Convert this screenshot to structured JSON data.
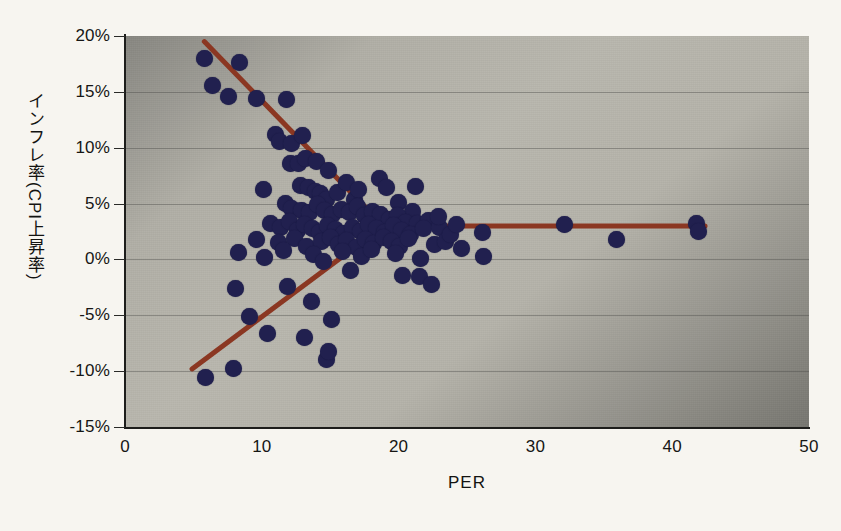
{
  "chart_data": {
    "type": "scatter",
    "title": "",
    "xlabel": "PER",
    "ylabel": "インフレ率(CPI上昇率)",
    "xlim": [
      0,
      50
    ],
    "ylim": [
      -15,
      20
    ],
    "x_ticks": [
      "0",
      "10",
      "20",
      "30",
      "40",
      "50"
    ],
    "x_tick_values": [
      0,
      10,
      20,
      30,
      40,
      50
    ],
    "y_ticks": [
      "20%",
      "15%",
      "10%",
      "5%",
      "0%",
      "-5%",
      "-10%",
      "-15%"
    ],
    "y_tick_values": [
      20,
      15,
      10,
      5,
      0,
      -5,
      -10,
      -15
    ],
    "grid": true,
    "grid_axis": "y",
    "legend": "none",
    "marker_color": "#21204f",
    "trend_color": "#8b3722",
    "plot_bg_color": "#b9b7ae",
    "page_bg_color": "#f7f5f0",
    "axis_color": "#1d1d1b",
    "series": [
      {
        "name": "国・地域",
        "marker": "circle",
        "points": [
          [
            5.8,
            18.0
          ],
          [
            6.4,
            15.6
          ],
          [
            7.6,
            14.6
          ],
          [
            8.4,
            17.6
          ],
          [
            9.6,
            14.4
          ],
          [
            11.8,
            14.3
          ],
          [
            11.0,
            11.2
          ],
          [
            11.3,
            10.6
          ],
          [
            12.2,
            10.4
          ],
          [
            13.0,
            11.1
          ],
          [
            12.1,
            8.6
          ],
          [
            12.7,
            8.6
          ],
          [
            13.2,
            9.0
          ],
          [
            14.0,
            8.8
          ],
          [
            14.9,
            8.0
          ],
          [
            10.1,
            6.3
          ],
          [
            12.8,
            6.6
          ],
          [
            13.4,
            6.4
          ],
          [
            13.9,
            6.1
          ],
          [
            14.3,
            5.9
          ],
          [
            14.7,
            5.4
          ],
          [
            15.5,
            6.0
          ],
          [
            16.2,
            6.9
          ],
          [
            16.8,
            5.4
          ],
          [
            17.1,
            6.3
          ],
          [
            18.6,
            7.2
          ],
          [
            19.1,
            6.4
          ],
          [
            21.2,
            6.5
          ],
          [
            20.0,
            5.1
          ],
          [
            21.0,
            4.3
          ],
          [
            11.7,
            5.0
          ],
          [
            12.2,
            4.6
          ],
          [
            12.9,
            4.4
          ],
          [
            13.5,
            4.2
          ],
          [
            14.1,
            4.9
          ],
          [
            14.6,
            4.4
          ],
          [
            15.2,
            4.0
          ],
          [
            15.8,
            4.5
          ],
          [
            16.4,
            4.2
          ],
          [
            17.0,
            4.7
          ],
          [
            17.5,
            3.9
          ],
          [
            18.1,
            4.3
          ],
          [
            18.7,
            4.0
          ],
          [
            19.3,
            3.6
          ],
          [
            19.9,
            3.9
          ],
          [
            20.5,
            3.3
          ],
          [
            21.4,
            3.2
          ],
          [
            22.2,
            3.5
          ],
          [
            10.6,
            3.2
          ],
          [
            11.4,
            2.9
          ],
          [
            12.0,
            3.4
          ],
          [
            12.6,
            2.6
          ],
          [
            13.1,
            3.1
          ],
          [
            13.7,
            2.8
          ],
          [
            14.2,
            2.4
          ],
          [
            14.8,
            3.0
          ],
          [
            15.4,
            2.7
          ],
          [
            16.0,
            2.3
          ],
          [
            16.6,
            2.9
          ],
          [
            17.2,
            2.5
          ],
          [
            17.8,
            3.1
          ],
          [
            18.4,
            2.8
          ],
          [
            19.0,
            2.4
          ],
          [
            19.6,
            3.0
          ],
          [
            20.2,
            2.6
          ],
          [
            20.9,
            2.2
          ],
          [
            21.8,
            2.8
          ],
          [
            23.0,
            2.9
          ],
          [
            9.6,
            1.8
          ],
          [
            11.2,
            1.5
          ],
          [
            12.4,
            1.9
          ],
          [
            13.3,
            1.2
          ],
          [
            14.4,
            1.6
          ],
          [
            15.0,
            2.0
          ],
          [
            15.6,
            1.3
          ],
          [
            16.2,
            1.7
          ],
          [
            16.9,
            1.1
          ],
          [
            17.6,
            1.8
          ],
          [
            18.2,
            1.4
          ],
          [
            18.9,
            2.0
          ],
          [
            19.5,
            1.6
          ],
          [
            20.1,
            1.2
          ],
          [
            20.7,
            1.9
          ],
          [
            22.6,
            1.3
          ],
          [
            23.4,
            1.6
          ],
          [
            8.3,
            0.6
          ],
          [
            10.2,
            0.2
          ],
          [
            11.6,
            0.8
          ],
          [
            13.8,
            0.4
          ],
          [
            14.5,
            -0.2
          ],
          [
            15.9,
            0.7
          ],
          [
            17.3,
            0.3
          ],
          [
            18.0,
            0.9
          ],
          [
            19.8,
            0.5
          ],
          [
            21.6,
            0.1
          ],
          [
            26.2,
            0.3
          ],
          [
            16.5,
            -1.0
          ],
          [
            20.3,
            -1.4
          ],
          [
            21.5,
            -1.5
          ],
          [
            22.4,
            -2.2
          ],
          [
            8.1,
            -2.6
          ],
          [
            11.9,
            -2.4
          ],
          [
            13.6,
            -3.8
          ],
          [
            15.1,
            -5.4
          ],
          [
            9.1,
            -5.1
          ],
          [
            10.4,
            -6.6
          ],
          [
            13.1,
            -7.0
          ],
          [
            14.7,
            -9.0
          ],
          [
            14.9,
            -8.2
          ],
          [
            7.9,
            -9.8
          ],
          [
            5.9,
            -10.6
          ],
          [
            26.1,
            2.4
          ],
          [
            32.1,
            3.1
          ],
          [
            35.9,
            1.8
          ],
          [
            41.8,
            3.2
          ],
          [
            41.9,
            2.5
          ],
          [
            23.8,
            2.2
          ],
          [
            24.6,
            1.0
          ],
          [
            24.2,
            3.1
          ],
          [
            22.9,
            3.8
          ]
        ]
      }
    ],
    "trend_lines": [
      {
        "name": "descending-trend-line",
        "x1": 5.8,
        "y1": 19.5,
        "x2": 18.9,
        "y2": 3.0
      },
      {
        "name": "ascending-trend-line",
        "x1": 4.9,
        "y1": -9.8,
        "x2": 18.9,
        "y2": 3.0
      },
      {
        "name": "flat-trend-line",
        "x1": 18.9,
        "y1": 3.0,
        "x2": 42.4,
        "y2": 3.0
      }
    ]
  }
}
